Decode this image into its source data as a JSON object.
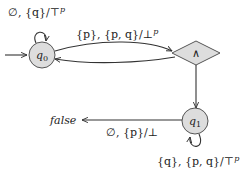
{
  "diagram": {
    "type": "automaton",
    "colors": {
      "state_fill": "#dddddd",
      "state_stroke": "#555555",
      "edge": "#333333",
      "text": "#222222",
      "background": "#ffffff"
    },
    "nodes": {
      "q0": {
        "label_main": "q",
        "label_sub": "0",
        "shape": "circle",
        "initial": true
      },
      "and": {
        "label": "∧",
        "shape": "diamond"
      },
      "q1": {
        "label_main": "q",
        "label_sub": "1",
        "shape": "circle"
      },
      "false": {
        "label": "false",
        "shape": "text"
      }
    },
    "edges": {
      "q0_self": {
        "from": "q0",
        "to": "q0",
        "label_main": "∅, {q}/⊤",
        "label_sup": "p"
      },
      "q0_to_and": {
        "from": "q0",
        "to": "and",
        "label_main": "{p}, {p, q}/⊥",
        "label_sup": "p"
      },
      "and_to_q0": {
        "from": "and",
        "to": "q0",
        "label_main": ""
      },
      "and_to_q1": {
        "from": "and",
        "to": "q1",
        "label_main": ""
      },
      "q1_to_false": {
        "from": "q1",
        "to": "false",
        "label_main": "∅, {p}/⊥"
      },
      "q1_self": {
        "from": "q1",
        "to": "q1",
        "label_main": "{q}, {p, q}/⊤",
        "label_sup": "p"
      }
    }
  }
}
